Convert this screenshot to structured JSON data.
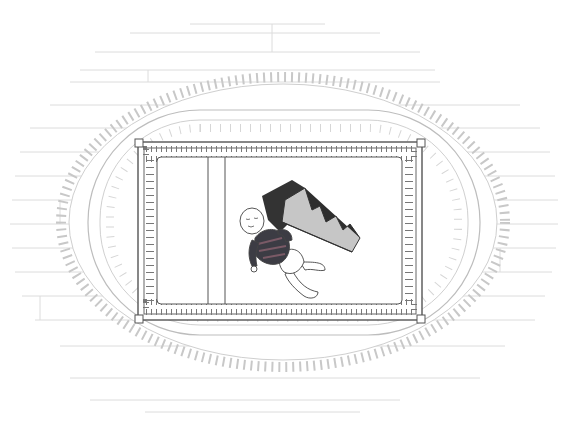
{
  "scene": {
    "description": "Top-down line illustration of an infant lying in a crib next to an inclined wedge cushion, crib on an oval fringed rug over a wooden floor",
    "width": 568,
    "height": 436
  },
  "colors": {
    "background": "#ffffff",
    "floor_lines": "#d8d8d8",
    "rug_lines": "#c4c4c4",
    "crib_lines": "#555555",
    "mattress": "#ffffff",
    "wedge_top": "#3a3a3a",
    "wedge_side": "#c9c9c9",
    "shirt_dark": "#3c3c44",
    "shirt_stripe": "#7a5a66",
    "skin": "#ffffff"
  },
  "objects": {
    "floor": "wooden-floor-planks",
    "rug": "oval-fringed-rug",
    "crib": "crib-with-slats",
    "mattress_divider_count": 2,
    "wedge": "incline-wedge-cushion",
    "baby": "infant-in-striped-shirt-and-diaper"
  }
}
